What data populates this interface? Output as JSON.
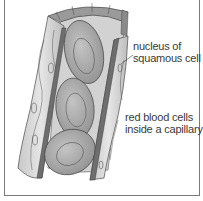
{
  "diagram": {
    "labels": {
      "nucleus_line1": "nucleus of",
      "nucleus_line2": "squamous cell",
      "rbc_line1": "red blood cells",
      "rbc_line2": "inside a capillary"
    },
    "colors": {
      "frame": "#7a7a7a",
      "wall_light": "#d9d9d9",
      "wall_mid": "#bdbdbd",
      "wall_cut": "#6e6e6e",
      "rbc": "#a9a9a9",
      "outline": "#4a4a4a",
      "text": "#3a3a3a"
    }
  }
}
